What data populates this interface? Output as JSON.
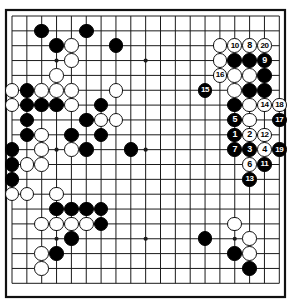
{
  "diagram": {
    "kind": "go-board-diagram",
    "board_size": 19,
    "title": "",
    "colors": {
      "board_background": "#ffffff",
      "line": "#1a1a1a",
      "border": "#111111",
      "black_stone": "#000000",
      "white_stone": "#ffffff",
      "white_stone_outline": "#101010",
      "label_on_black": "#ffffff",
      "label_on_white": "#000000"
    },
    "geometry": {
      "origin_x": 12,
      "origin_y": 16,
      "step": 14.85,
      "stone_diameter": 14.6,
      "border_left": 6,
      "border_top": 10,
      "border_right": 285,
      "border_bottom": 297
    },
    "star_points": [
      {
        "col": 3,
        "row": 3
      },
      {
        "col": 9,
        "row": 3
      },
      {
        "col": 15,
        "row": 3
      },
      {
        "col": 3,
        "row": 9
      },
      {
        "col": 9,
        "row": 9
      },
      {
        "col": 15,
        "row": 9
      },
      {
        "col": 3,
        "row": 15
      },
      {
        "col": 9,
        "row": 15
      },
      {
        "col": 15,
        "row": 15
      }
    ],
    "stones": [
      {
        "col": 2,
        "row": 1,
        "color": "black",
        "label": ""
      },
      {
        "col": 5,
        "row": 1,
        "color": "black",
        "label": ""
      },
      {
        "col": 14,
        "row": 2,
        "color": "white",
        "label": ""
      },
      {
        "col": 15,
        "row": 2,
        "color": "white",
        "label": "10"
      },
      {
        "col": 16,
        "row": 2,
        "color": "white",
        "label": "8"
      },
      {
        "col": 17,
        "row": 2,
        "color": "white",
        "label": "20"
      },
      {
        "col": 3,
        "row": 2,
        "color": "black",
        "label": ""
      },
      {
        "col": 4,
        "row": 2,
        "color": "white",
        "label": ""
      },
      {
        "col": 7,
        "row": 2,
        "color": "black",
        "label": ""
      },
      {
        "col": 4,
        "row": 3,
        "color": "white",
        "label": ""
      },
      {
        "col": 14,
        "row": 3,
        "color": "white",
        "label": ""
      },
      {
        "col": 15,
        "row": 3,
        "color": "black",
        "label": ""
      },
      {
        "col": 16,
        "row": 3,
        "color": "black",
        "label": ""
      },
      {
        "col": 17,
        "row": 3,
        "color": "black",
        "label": "9"
      },
      {
        "col": 3,
        "row": 4,
        "color": "white",
        "label": ""
      },
      {
        "col": 14,
        "row": 4,
        "color": "white",
        "label": "16"
      },
      {
        "col": 15,
        "row": 4,
        "color": "white",
        "label": ""
      },
      {
        "col": 16,
        "row": 4,
        "color": "white",
        "label": ""
      },
      {
        "col": 17,
        "row": 4,
        "color": "black",
        "label": ""
      },
      {
        "col": 0,
        "row": 5,
        "color": "white",
        "label": ""
      },
      {
        "col": 1,
        "row": 5,
        "color": "black",
        "label": ""
      },
      {
        "col": 2,
        "row": 5,
        "color": "white",
        "label": ""
      },
      {
        "col": 3,
        "row": 5,
        "color": "white",
        "label": ""
      },
      {
        "col": 4,
        "row": 5,
        "color": "white",
        "label": ""
      },
      {
        "col": 7,
        "row": 5,
        "color": "white",
        "label": ""
      },
      {
        "col": 13,
        "row": 5,
        "color": "black",
        "label": "15"
      },
      {
        "col": 15,
        "row": 5,
        "color": "white",
        "label": ""
      },
      {
        "col": 16,
        "row": 5,
        "color": "black",
        "label": ""
      },
      {
        "col": 17,
        "row": 5,
        "color": "black",
        "label": ""
      },
      {
        "col": 0,
        "row": 6,
        "color": "white",
        "label": ""
      },
      {
        "col": 1,
        "row": 6,
        "color": "black",
        "label": ""
      },
      {
        "col": 2,
        "row": 6,
        "color": "black",
        "label": ""
      },
      {
        "col": 3,
        "row": 6,
        "color": "black",
        "label": ""
      },
      {
        "col": 4,
        "row": 6,
        "color": "white",
        "label": ""
      },
      {
        "col": 6,
        "row": 6,
        "color": "black",
        "label": ""
      },
      {
        "col": 15,
        "row": 6,
        "color": "black",
        "label": ""
      },
      {
        "col": 16,
        "row": 6,
        "color": "white",
        "label": ""
      },
      {
        "col": 17,
        "row": 6,
        "color": "white",
        "label": "14"
      },
      {
        "col": 18,
        "row": 6,
        "color": "white",
        "label": "18"
      },
      {
        "col": 1,
        "row": 7,
        "color": "black",
        "label": ""
      },
      {
        "col": 5,
        "row": 7,
        "color": "black",
        "label": ""
      },
      {
        "col": 6,
        "row": 7,
        "color": "white",
        "label": ""
      },
      {
        "col": 7,
        "row": 7,
        "color": "white",
        "label": ""
      },
      {
        "col": 15,
        "row": 7,
        "color": "black",
        "label": "5"
      },
      {
        "col": 16,
        "row": 7,
        "color": "white",
        "label": ""
      },
      {
        "col": 18,
        "row": 7,
        "color": "black",
        "label": "17"
      },
      {
        "col": 1,
        "row": 8,
        "color": "black",
        "label": ""
      },
      {
        "col": 2,
        "row": 8,
        "color": "white",
        "label": ""
      },
      {
        "col": 4,
        "row": 8,
        "color": "black",
        "label": ""
      },
      {
        "col": 6,
        "row": 8,
        "color": "black",
        "label": ""
      },
      {
        "col": 15,
        "row": 8,
        "color": "black",
        "label": "1"
      },
      {
        "col": 16,
        "row": 8,
        "color": "white",
        "label": "2"
      },
      {
        "col": 17,
        "row": 8,
        "color": "white",
        "label": "12"
      },
      {
        "col": 0,
        "row": 9,
        "color": "black",
        "label": ""
      },
      {
        "col": 2,
        "row": 9,
        "color": "white",
        "label": ""
      },
      {
        "col": 4,
        "row": 9,
        "color": "white",
        "label": ""
      },
      {
        "col": 5,
        "row": 9,
        "color": "black",
        "label": ""
      },
      {
        "col": 8,
        "row": 9,
        "color": "black",
        "label": ""
      },
      {
        "col": 15,
        "row": 9,
        "color": "black",
        "label": "7"
      },
      {
        "col": 16,
        "row": 9,
        "color": "black",
        "label": "3"
      },
      {
        "col": 17,
        "row": 9,
        "color": "white",
        "label": "4"
      },
      {
        "col": 18,
        "row": 9,
        "color": "black",
        "label": "19"
      },
      {
        "col": 0,
        "row": 10,
        "color": "black",
        "label": ""
      },
      {
        "col": 1,
        "row": 10,
        "color": "white",
        "label": ""
      },
      {
        "col": 2,
        "row": 10,
        "color": "white",
        "label": ""
      },
      {
        "col": 16,
        "row": 10,
        "color": "white",
        "label": "6"
      },
      {
        "col": 17,
        "row": 10,
        "color": "black",
        "label": "11"
      },
      {
        "col": 0,
        "row": 11,
        "color": "black",
        "label": ""
      },
      {
        "col": 16,
        "row": 11,
        "color": "black",
        "label": "13"
      },
      {
        "col": 0,
        "row": 12,
        "color": "white",
        "label": ""
      },
      {
        "col": 1,
        "row": 12,
        "color": "white",
        "label": ""
      },
      {
        "col": 3,
        "row": 12,
        "color": "white",
        "label": ""
      },
      {
        "col": 3,
        "row": 13,
        "color": "black",
        "label": ""
      },
      {
        "col": 4,
        "row": 13,
        "color": "black",
        "label": ""
      },
      {
        "col": 5,
        "row": 13,
        "color": "black",
        "label": ""
      },
      {
        "col": 6,
        "row": 13,
        "color": "black",
        "label": ""
      },
      {
        "col": 2,
        "row": 14,
        "color": "white",
        "label": ""
      },
      {
        "col": 3,
        "row": 14,
        "color": "white",
        "label": ""
      },
      {
        "col": 4,
        "row": 14,
        "color": "white",
        "label": ""
      },
      {
        "col": 5,
        "row": 14,
        "color": "white",
        "label": ""
      },
      {
        "col": 6,
        "row": 14,
        "color": "black",
        "label": ""
      },
      {
        "col": 4,
        "row": 15,
        "color": "black",
        "label": ""
      },
      {
        "col": 13,
        "row": 15,
        "color": "black",
        "label": ""
      },
      {
        "col": 15,
        "row": 14,
        "color": "white",
        "label": ""
      },
      {
        "col": 16,
        "row": 15,
        "color": "white",
        "label": ""
      },
      {
        "col": 15,
        "row": 16,
        "color": "black",
        "label": ""
      },
      {
        "col": 16,
        "row": 16,
        "color": "white",
        "label": ""
      },
      {
        "col": 2,
        "row": 16,
        "color": "white",
        "label": ""
      },
      {
        "col": 3,
        "row": 16,
        "color": "black",
        "label": ""
      },
      {
        "col": 16,
        "row": 17,
        "color": "black",
        "label": ""
      },
      {
        "col": 2,
        "row": 17,
        "color": "white",
        "label": ""
      }
    ],
    "move_sequence": [
      {
        "move": "1",
        "color": "black"
      },
      {
        "move": "2",
        "color": "white"
      },
      {
        "move": "3",
        "color": "black"
      },
      {
        "move": "4",
        "color": "white"
      },
      {
        "move": "5",
        "color": "black"
      },
      {
        "move": "6",
        "color": "white"
      },
      {
        "move": "7",
        "color": "black"
      },
      {
        "move": "8",
        "color": "white"
      },
      {
        "move": "9",
        "color": "black"
      },
      {
        "move": "10",
        "color": "white"
      },
      {
        "move": "11",
        "color": "black"
      },
      {
        "move": "12",
        "color": "white"
      },
      {
        "move": "13",
        "color": "black"
      },
      {
        "move": "14",
        "color": "white"
      },
      {
        "move": "15",
        "color": "black"
      },
      {
        "move": "16",
        "color": "white"
      },
      {
        "move": "17",
        "color": "black"
      },
      {
        "move": "18",
        "color": "white"
      },
      {
        "move": "19",
        "color": "black"
      },
      {
        "move": "20",
        "color": "white"
      }
    ]
  }
}
